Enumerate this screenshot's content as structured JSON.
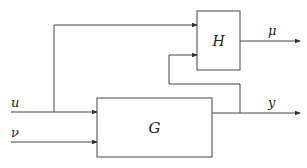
{
  "diagram": {
    "type": "block-diagram",
    "blocks": [
      {
        "id": "G",
        "label": "G"
      },
      {
        "id": "H",
        "label": "H"
      }
    ],
    "signals": {
      "u": "u",
      "nu": "ν",
      "y": "y",
      "mu": "μ"
    },
    "edges": [
      {
        "from": "u",
        "to": "G"
      },
      {
        "from": "u",
        "to": "H"
      },
      {
        "from": "nu",
        "to": "G"
      },
      {
        "from": "G",
        "to": "y"
      },
      {
        "from": "y",
        "to": "H"
      },
      {
        "from": "H",
        "to": "mu"
      }
    ],
    "colors": {
      "stroke": "#444444",
      "background": "#ffffff"
    }
  }
}
